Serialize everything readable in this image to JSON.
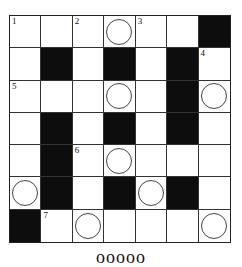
{
  "puzzle": {
    "rows": 7,
    "cols": 7,
    "cells": [
      [
        {
          "t": "w",
          "n": "1"
        },
        {
          "t": "w"
        },
        {
          "t": "w",
          "n": "2"
        },
        {
          "t": "w",
          "c": true
        },
        {
          "t": "w",
          "n": "3"
        },
        {
          "t": "w"
        },
        {
          "t": "b"
        }
      ],
      [
        {
          "t": "w"
        },
        {
          "t": "b"
        },
        {
          "t": "w"
        },
        {
          "t": "b"
        },
        {
          "t": "w"
        },
        {
          "t": "b"
        },
        {
          "t": "w",
          "n": "4"
        }
      ],
      [
        {
          "t": "w",
          "n": "5"
        },
        {
          "t": "w"
        },
        {
          "t": "w"
        },
        {
          "t": "w",
          "c": true
        },
        {
          "t": "w"
        },
        {
          "t": "b"
        },
        {
          "t": "w",
          "c": true
        }
      ],
      [
        {
          "t": "w"
        },
        {
          "t": "b"
        },
        {
          "t": "w"
        },
        {
          "t": "b"
        },
        {
          "t": "w"
        },
        {
          "t": "b"
        },
        {
          "t": "w"
        }
      ],
      [
        {
          "t": "w"
        },
        {
          "t": "b"
        },
        {
          "t": "w",
          "n": "6"
        },
        {
          "t": "w",
          "c": true
        },
        {
          "t": "w"
        },
        {
          "t": "w"
        },
        {
          "t": "w"
        }
      ],
      [
        {
          "t": "w",
          "c": true
        },
        {
          "t": "b"
        },
        {
          "t": "w"
        },
        {
          "t": "b"
        },
        {
          "t": "w",
          "c": true
        },
        {
          "t": "b"
        },
        {
          "t": "w"
        }
      ],
      [
        {
          "t": "b"
        },
        {
          "t": "w",
          "n": "7"
        },
        {
          "t": "w",
          "c": true
        },
        {
          "t": "w"
        },
        {
          "t": "w"
        },
        {
          "t": "w"
        },
        {
          "t": "w",
          "c": true
        }
      ]
    ]
  },
  "footer": {
    "answer_blanks": "ooooo"
  },
  "colors": {
    "black_cell": "#0d0d0d",
    "grid_line": "#333333",
    "background": "#ffffff"
  }
}
